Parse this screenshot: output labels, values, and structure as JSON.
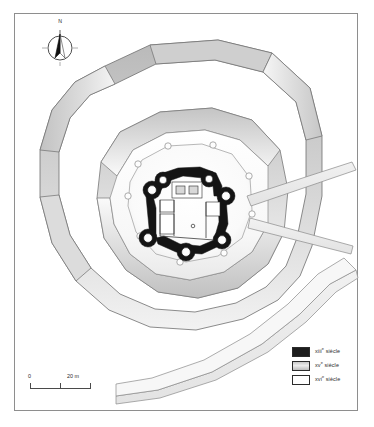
{
  "figure": {
    "kind": "archaeological-site-plan",
    "background_color": "#ffffff",
    "frame_color": "#8e8e8e"
  },
  "compass": {
    "name": "north-arrow",
    "north_label": "N",
    "needle_dark_color": "#111111",
    "needle_light_color": "#ffffff"
  },
  "scale": {
    "name": "scale-bar",
    "min_label": "0",
    "max_label": "20 m",
    "unit": "m",
    "length_value": 20,
    "ticks": [
      0,
      10,
      20
    ],
    "line_color": "#4a4a4a"
  },
  "legend": {
    "title": "",
    "entries": [
      {
        "label": "xiii",
        "suffix": "e",
        "period": " siècle",
        "full": "xiiie siècle",
        "swatch": "c13",
        "color": "#1d1d1d"
      },
      {
        "label": "xv",
        "suffix": "e",
        "period": " siècle",
        "full": "xve siècle",
        "swatch": "c15",
        "color": "#c9c9c9"
      },
      {
        "label": "xvi",
        "suffix": "e",
        "period": " siècle",
        "full": "xvie siècle",
        "swatch": "c16",
        "color": "#ffffff"
      }
    ]
  },
  "plan_elements": {
    "outer_enceinte": {
      "name": "outer-curtain-wall",
      "period": "xvie siècle",
      "fill": "#d9d9d9",
      "stroke": "#6f6f6f",
      "description": "Polygonal outer bastioned enceinte, shaded gradient band"
    },
    "middle_enceinte": {
      "name": "middle-curtain-wall",
      "period": "xve siècle",
      "fill": "#cfcfcf",
      "stroke": "#777777",
      "description": "Inner polygonal rampart with gradient shaded faces"
    },
    "inner_platform": {
      "name": "inner-platform",
      "period": "xve siècle",
      "fill": "#fbfbfb",
      "stroke": "#8a8a8a"
    },
    "keep": {
      "name": "castle-keep",
      "period": "xiiie siècle",
      "fill": "#141414",
      "stroke": "#141414",
      "description": "Black masonry walls with circular corner towers"
    },
    "causeway": {
      "name": "access-causeway",
      "period": "xvie siècle",
      "fill": "#ececec",
      "stroke": "#8a8a8a",
      "description": "Diagonal bridge / access ramp to the east"
    },
    "south_wall_band": {
      "name": "south-outer-wall-band",
      "period": "xvie siècle",
      "fill": "#ededed",
      "stroke": "#8a8a8a"
    }
  }
}
